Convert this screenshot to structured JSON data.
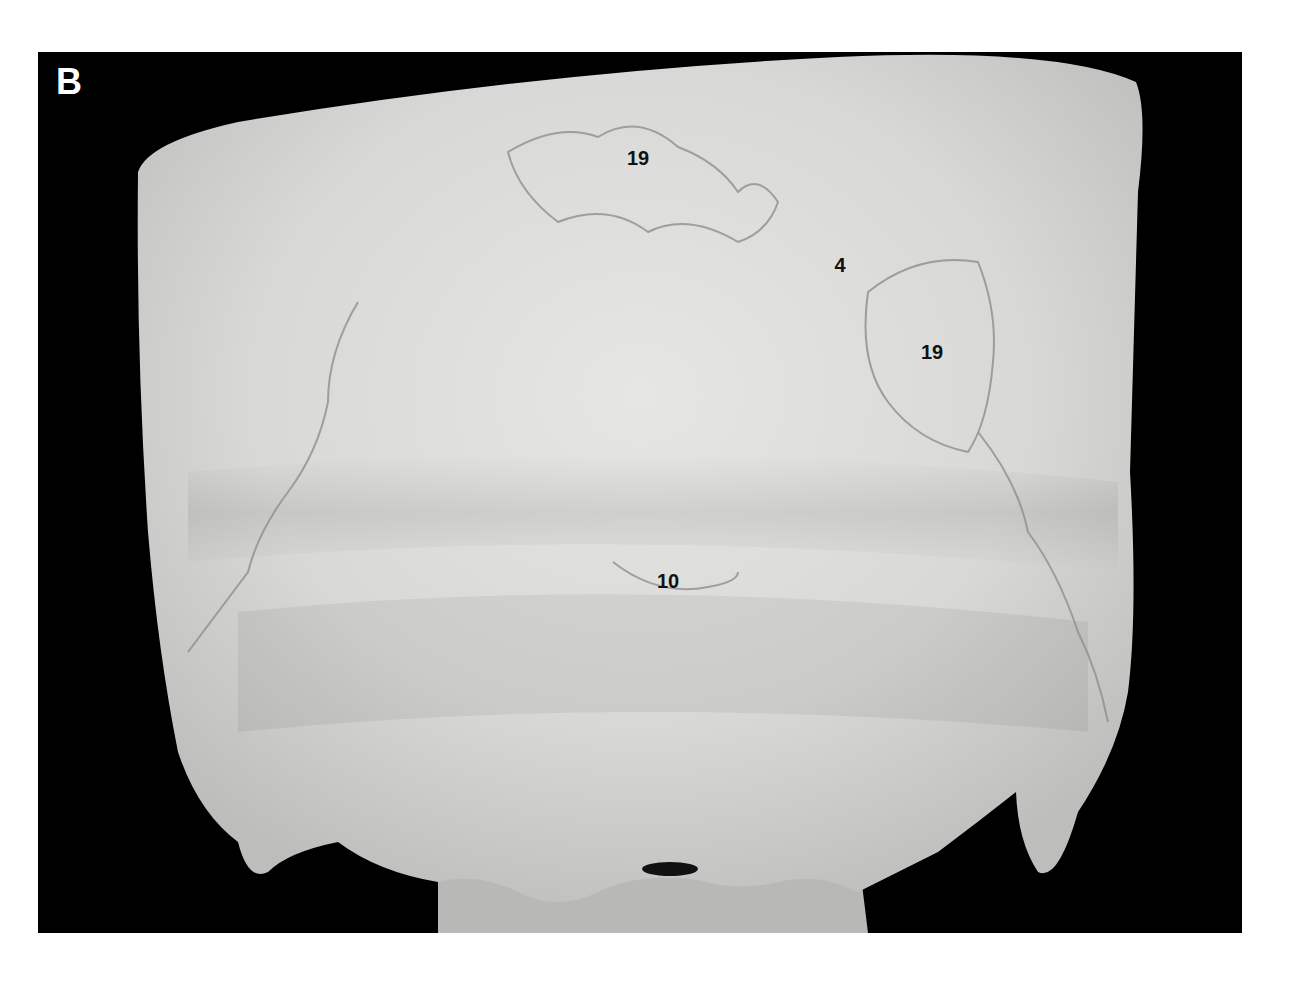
{
  "figure": {
    "panel_letter": "B",
    "background_color": "#000000",
    "bone_color": "#dcdcda",
    "labels": [
      {
        "id": "label-19-top",
        "text": "19",
        "x": 638,
        "y": 158
      },
      {
        "id": "label-4",
        "text": "4",
        "x": 840,
        "y": 265
      },
      {
        "id": "label-19-right",
        "text": "19",
        "x": 932,
        "y": 352
      },
      {
        "id": "label-10",
        "text": "10",
        "x": 668,
        "y": 581
      }
    ]
  }
}
